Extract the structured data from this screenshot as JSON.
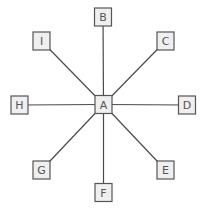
{
  "diagram": {
    "type": "star",
    "hub": "A",
    "node_size": {
      "width": 17,
      "height": 18
    },
    "colors": {
      "node_fill": "#efefef",
      "node_border": "#555555",
      "label": "#555555",
      "edge": "#4a4a4a",
      "background": "#ffffff"
    },
    "nodes": [
      {
        "id": "A",
        "label": "A",
        "cx": 103.5,
        "cy": 104.5
      },
      {
        "id": "B",
        "label": "B",
        "cx": 103,
        "cy": 17
      },
      {
        "id": "C",
        "label": "C",
        "cx": 165.5,
        "cy": 41
      },
      {
        "id": "D",
        "label": "D",
        "cx": 187,
        "cy": 105
      },
      {
        "id": "E",
        "label": "E",
        "cx": 165.5,
        "cy": 170
      },
      {
        "id": "F",
        "label": "F",
        "cx": 103.5,
        "cy": 192.5
      },
      {
        "id": "G",
        "label": "G",
        "cx": 41.5,
        "cy": 170
      },
      {
        "id": "H",
        "label": "H",
        "cx": 19.5,
        "cy": 105
      },
      {
        "id": "I",
        "label": "I",
        "cx": 41.5,
        "cy": 41
      }
    ],
    "edges": [
      {
        "from": "A",
        "to": "B"
      },
      {
        "from": "A",
        "to": "C"
      },
      {
        "from": "A",
        "to": "D"
      },
      {
        "from": "A",
        "to": "E"
      },
      {
        "from": "A",
        "to": "F"
      },
      {
        "from": "A",
        "to": "G"
      },
      {
        "from": "A",
        "to": "H"
      },
      {
        "from": "A",
        "to": "I"
      }
    ]
  }
}
